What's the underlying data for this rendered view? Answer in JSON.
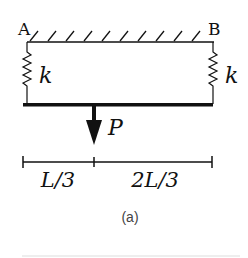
{
  "diagram": {
    "support_labels": {
      "left": "A",
      "right": "B"
    },
    "spring_labels": {
      "left": "k",
      "right": "k"
    },
    "load_label": "P",
    "dimensions": [
      {
        "label": "L/3"
      },
      {
        "label": "2L/3"
      }
    ],
    "caption": "(a)",
    "colors": {
      "ink": "#111111",
      "caption": "#444444"
    }
  }
}
